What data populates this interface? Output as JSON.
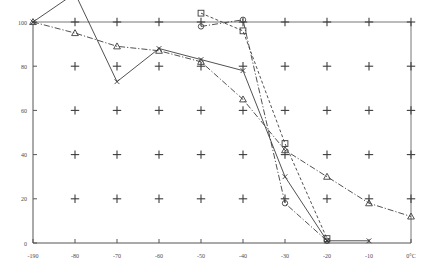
{
  "chart_data": {
    "type": "line",
    "title": "",
    "subtitle": "",
    "xlabel": "",
    "ylabel": "",
    "x_unit_label": "0°C",
    "xlim": [
      -190,
      0
    ],
    "ylim": [
      0,
      100
    ],
    "grid": "plus-markers",
    "legend_position": "none",
    "x_tick_labels": [
      "-190",
      "-80",
      "-70",
      "-60",
      "-50",
      "-40",
      "-30",
      "-20",
      "-10",
      "0°C"
    ],
    "x_tick_values": [
      -190,
      -80,
      -70,
      -60,
      -50,
      -40,
      -30,
      -20,
      -10,
      0
    ],
    "y_tick_labels": [
      "0",
      "20",
      "40",
      "60",
      "80",
      "100"
    ],
    "y_tick_values": [
      0,
      20,
      40,
      60,
      80,
      100
    ],
    "grid_plus_rows": [
      20,
      40,
      60,
      80,
      100
    ],
    "grid_plus_cols": [
      -80,
      -70,
      -60,
      -50,
      -40,
      -30,
      -20,
      -10,
      0
    ],
    "series": [
      {
        "name": "series-x-solid",
        "marker": "x",
        "line_style": "solid",
        "x": [
          -190,
          -80,
          -70,
          -60,
          -50,
          -40,
          -30,
          -20
        ],
        "values": [
          100,
          113,
          73,
          88,
          83,
          78,
          30,
          1
        ]
      },
      {
        "name": "series-triangle-dashdot",
        "marker": "triangle",
        "line_style": "dash-dot",
        "x": [
          -190,
          -80,
          -70,
          -60,
          -50,
          -40,
          -30,
          -20,
          -10,
          0
        ],
        "values": [
          100,
          95,
          89,
          87,
          82,
          65,
          42,
          30,
          18,
          12
        ]
      },
      {
        "name": "series-square-dashed",
        "marker": "square",
        "line_style": "dashed",
        "x": [
          -50,
          -40,
          -30,
          -20
        ],
        "values": [
          104,
          96,
          45,
          2
        ]
      },
      {
        "name": "series-circle-dashdot",
        "marker": "circle",
        "line_style": "dash-dot",
        "x": [
          -50,
          -40,
          -30,
          -20
        ],
        "values": [
          98,
          101,
          18,
          1
        ]
      },
      {
        "name": "series-x-tail",
        "marker": "x",
        "line_style": "solid",
        "x": [
          -20,
          -10
        ],
        "values": [
          1,
          1
        ]
      }
    ]
  }
}
